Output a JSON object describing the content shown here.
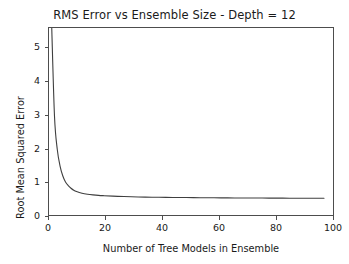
{
  "chart_data": {
    "type": "line",
    "title": "RMS Error vs Ensemble Size - Depth = 12",
    "xlabel": "Number of Tree Models in Ensemble",
    "ylabel": "Root Mean Squared Error",
    "xlim": [
      0,
      104
    ],
    "ylim": [
      0,
      5.72
    ],
    "xticks": [
      0,
      20,
      40,
      60,
      80,
      100
    ],
    "yticks": [
      0,
      1,
      2,
      3,
      4,
      5
    ],
    "xtick_labels": [
      "0",
      "20",
      "40",
      "60",
      "80",
      "100"
    ],
    "ytick_labels": [
      "0",
      "1",
      "2",
      "3",
      "4",
      "5"
    ],
    "grid": false,
    "legend": "none",
    "series": [
      {
        "name": "RMSE",
        "color": "#3f3f3f",
        "linewidth": 1.1,
        "x": [
          1,
          2,
          3,
          4,
          5,
          6,
          7,
          8,
          9,
          10,
          12,
          14,
          16,
          18,
          20,
          25,
          30,
          35,
          40,
          45,
          50,
          55,
          60,
          65,
          70,
          75,
          80,
          85,
          90,
          95,
          100
        ],
        "y": [
          5.72,
          3.05,
          2.05,
          1.55,
          1.25,
          1.06,
          0.95,
          0.87,
          0.81,
          0.77,
          0.72,
          0.69,
          0.67,
          0.655,
          0.645,
          0.625,
          0.612,
          0.603,
          0.597,
          0.592,
          0.588,
          0.584,
          0.581,
          0.578,
          0.576,
          0.574,
          0.572,
          0.57,
          0.569,
          0.568,
          0.567
        ]
      }
    ]
  }
}
